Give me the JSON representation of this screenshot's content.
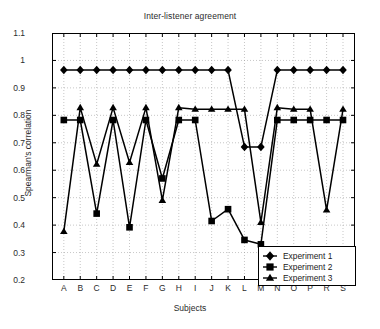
{
  "chart_data": {
    "type": "line",
    "title": "Inter-listener agreement",
    "xlabel": "Subjects",
    "ylabel": "Spearman's correlation",
    "grid": true,
    "legend_position": "lower right",
    "ylim": [
      0.2,
      1.1
    ],
    "yticks": [
      "1.1",
      "1",
      "0.9",
      "0.8",
      "0.7",
      "0.6",
      "0.5",
      "0.4",
      "0.3",
      "0.2"
    ],
    "ytick_values": [
      1.1,
      1.0,
      0.9,
      0.8,
      0.7,
      0.6,
      0.5,
      0.4,
      0.3,
      0.2
    ],
    "categories": [
      "A",
      "B",
      "C",
      "D",
      "E",
      "F",
      "G",
      "H",
      "I",
      "J",
      "K",
      "L",
      "M",
      "N",
      "O",
      "P",
      "R",
      "S"
    ],
    "series": [
      {
        "name": "Experiment 1",
        "marker": "diamond",
        "color": "#000000",
        "values": [
          0.965,
          0.965,
          0.965,
          0.965,
          0.965,
          0.965,
          0.965,
          0.965,
          0.965,
          0.965,
          0.965,
          0.685,
          0.685,
          0.965,
          0.965,
          0.965,
          0.965,
          0.965
        ]
      },
      {
        "name": "Experiment 2",
        "marker": "square",
        "color": "#000000",
        "values": [
          0.783,
          0.783,
          0.442,
          0.783,
          0.392,
          0.783,
          0.57,
          0.783,
          0.783,
          0.415,
          0.458,
          0.346,
          0.33,
          0.783,
          0.783,
          0.783,
          0.783,
          0.783
        ]
      },
      {
        "name": "Experiment 3",
        "marker": "triangle",
        "color": "#000000",
        "values": [
          0.377,
          0.828,
          0.622,
          0.828,
          0.628,
          0.828,
          0.49,
          0.828,
          0.822,
          0.822,
          0.822,
          0.822,
          0.41,
          0.828,
          0.822,
          0.822,
          0.455,
          0.822
        ]
      }
    ]
  },
  "legend": {
    "items": [
      {
        "label": "Experiment 1",
        "marker": "diamond"
      },
      {
        "label": "Experiment 2",
        "marker": "square"
      },
      {
        "label": "Experiment 3",
        "marker": "triangle"
      }
    ]
  }
}
